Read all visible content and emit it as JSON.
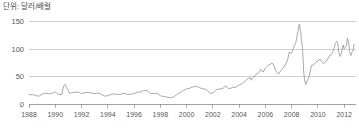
{
  "unit_label": "단위: 달러/배럴",
  "colors": {
    "line": "#9a9a9a",
    "grid": "#b9b9b9",
    "axis": "#8a8a8a",
    "text": "#585858",
    "background": "#ffffff"
  },
  "chart_data": {
    "type": "line",
    "title": "",
    "subtitle": "",
    "xlabel": "",
    "ylabel": "단위: 달러/배럴",
    "legend": [],
    "legend_position": "none",
    "grid": true,
    "xlim": [
      1988,
      2012.9
    ],
    "ylim": [
      0,
      160
    ],
    "ytick_labels": [
      "0",
      "50",
      "100",
      "150"
    ],
    "ytick_values": [
      0,
      50,
      100,
      150
    ],
    "xtick_labels": [
      "1988",
      "1990",
      "1992",
      "1994",
      "1996",
      "1998",
      "2000",
      "2002",
      "2004",
      "2006",
      "2008",
      "2010",
      "2012"
    ],
    "xtick_values": [
      1988,
      1990,
      1992,
      1994,
      1996,
      1998,
      2000,
      2002,
      2004,
      2006,
      2008,
      2010,
      2012
    ],
    "series": [
      {
        "name": "유가",
        "x": [
          1988.0,
          1988.25,
          1988.5,
          1988.75,
          1989.0,
          1989.25,
          1989.5,
          1989.75,
          1990.0,
          1990.25,
          1990.5,
          1990.58,
          1990.67,
          1990.75,
          1990.83,
          1990.92,
          1991.0,
          1991.08,
          1991.25,
          1991.5,
          1991.75,
          1992.0,
          1992.25,
          1992.5,
          1992.75,
          1993.0,
          1993.25,
          1993.5,
          1993.75,
          1994.0,
          1994.25,
          1994.5,
          1994.75,
          1995.0,
          1995.25,
          1995.5,
          1995.75,
          1996.0,
          1996.25,
          1996.5,
          1996.75,
          1997.0,
          1997.25,
          1997.5,
          1997.75,
          1998.0,
          1998.25,
          1998.5,
          1998.75,
          1999.0,
          1999.25,
          1999.5,
          1999.75,
          2000.0,
          2000.25,
          2000.5,
          2000.75,
          2001.0,
          2001.25,
          2001.5,
          2001.75,
          2002.0,
          2002.25,
          2002.5,
          2002.75,
          2003.0,
          2003.17,
          2003.33,
          2003.5,
          2003.75,
          2004.0,
          2004.25,
          2004.5,
          2004.83,
          2004.92,
          2005.0,
          2005.25,
          2005.5,
          2005.67,
          2005.83,
          2006.0,
          2006.25,
          2006.5,
          2006.58,
          2006.83,
          2007.0,
          2007.17,
          2007.42,
          2007.67,
          2007.83,
          2007.92,
          2008.0,
          2008.17,
          2008.33,
          2008.42,
          2008.5,
          2008.58,
          2008.67,
          2008.75,
          2008.83,
          2008.92,
          2009.0,
          2009.08,
          2009.17,
          2009.33,
          2009.5,
          2009.67,
          2009.83,
          2009.92,
          2010.0,
          2010.17,
          2010.33,
          2010.42,
          2010.58,
          2010.75,
          2010.92,
          2011.0,
          2011.08,
          2011.25,
          2011.33,
          2011.42,
          2011.5,
          2011.58,
          2011.67,
          2011.75,
          2011.83,
          2011.92,
          2012.0,
          2012.08,
          2012.17,
          2012.25,
          2012.33,
          2012.42,
          2012.5,
          2012.58,
          2012.67,
          2012.75
        ],
        "values": [
          16.8,
          17.2,
          15.5,
          14.0,
          17.9,
          19.7,
          18.3,
          19.2,
          22.1,
          17.5,
          17.0,
          27.3,
          33.5,
          35.9,
          32.3,
          27.3,
          24.5,
          19.4,
          20.3,
          21.4,
          21.7,
          18.9,
          20.5,
          21.4,
          19.9,
          19.0,
          19.9,
          17.6,
          14.5,
          15.0,
          17.6,
          18.4,
          17.2,
          18.0,
          19.4,
          17.3,
          17.7,
          18.9,
          21.4,
          21.9,
          24.6,
          24.2,
          19.1,
          19.2,
          19.5,
          15.2,
          13.5,
          12.6,
          11.3,
          12.5,
          17.0,
          20.9,
          24.9,
          27.2,
          28.8,
          31.3,
          32.2,
          29.6,
          27.4,
          26.6,
          19.7,
          19.7,
          26.3,
          27.0,
          28.3,
          33.0,
          28.2,
          28.1,
          30.3,
          30.3,
          34.3,
          37.6,
          43.0,
          48.3,
          43.2,
          46.8,
          53.0,
          57.0,
          62.9,
          58.0,
          65.5,
          70.8,
          74.4,
          73.0,
          58.9,
          54.2,
          60.6,
          67.5,
          78.2,
          94.6,
          91.7,
          92.9,
          104.1,
          112.6,
          125.4,
          133.9,
          145.3,
          133.4,
          116.6,
          100.6,
          57.3,
          41.7,
          35.4,
          41.5,
          49.6,
          69.7,
          71.0,
          75.8,
          77.9,
          78.3,
          81.2,
          75.3,
          73.7,
          76.3,
          81.9,
          89.2,
          89.2,
          92.1,
          102.9,
          110.0,
          113.9,
          112.3,
          95.9,
          86.3,
          88.8,
          97.2,
          107.4,
          100.3,
          103.1,
          106.2,
          119.8,
          113.3,
          94.7,
          87.9,
          94.1,
          96.0,
          108.0
        ]
      }
    ],
    "annotations": [
      {
        "text": "1990 Gulf War spike",
        "x": 1990.75,
        "y": 35.9
      },
      {
        "text": "2008 peak",
        "x": 2008.58,
        "y": 145.3
      },
      {
        "text": "2008-2009 crash trough",
        "x": 2009.08,
        "y": 35.4
      }
    ]
  }
}
